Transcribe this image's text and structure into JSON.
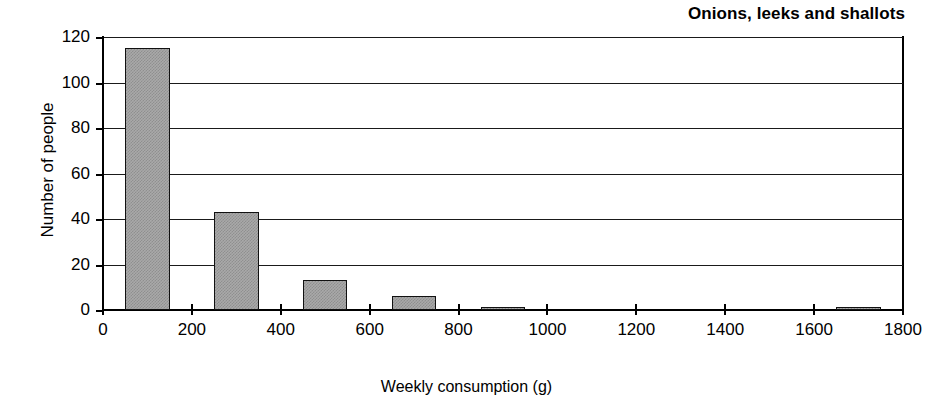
{
  "chart_data": {
    "type": "bar",
    "title": "Onions, leeks and shallots",
    "xlabel": "Weekly consumption (g)",
    "ylabel": "Number of people",
    "xlim": [
      0,
      1800
    ],
    "ylim": [
      0,
      120
    ],
    "grid": true,
    "legend": "none",
    "bin_width": 100,
    "xticks": [
      {
        "value": 0,
        "label": "0"
      },
      {
        "value": 200,
        "label": "200"
      },
      {
        "value": 400,
        "label": "400"
      },
      {
        "value": 600,
        "label": "600"
      },
      {
        "value": 800,
        "label": "800"
      },
      {
        "value": 1000,
        "label": "1000"
      },
      {
        "value": 1200,
        "label": "1200"
      },
      {
        "value": 1400,
        "label": "1400"
      },
      {
        "value": 1600,
        "label": "1600"
      },
      {
        "value": 1800,
        "label": "1800"
      }
    ],
    "yticks": [
      {
        "value": 0,
        "label": "0"
      },
      {
        "value": 20,
        "label": "20"
      },
      {
        "value": 40,
        "label": "40"
      },
      {
        "value": 60,
        "label": "60"
      },
      {
        "value": 80,
        "label": "80"
      },
      {
        "value": 100,
        "label": "100"
      },
      {
        "value": 120,
        "label": "120"
      }
    ],
    "bars": [
      {
        "x_start": 50,
        "x_end": 150,
        "center": 100,
        "value": 115
      },
      {
        "x_start": 250,
        "x_end": 350,
        "center": 300,
        "value": 43
      },
      {
        "x_start": 450,
        "x_end": 550,
        "center": 500,
        "value": 13
      },
      {
        "x_start": 650,
        "x_end": 750,
        "center": 700,
        "value": 6
      },
      {
        "x_start": 850,
        "x_end": 950,
        "center": 900,
        "value": 1.5
      },
      {
        "x_start": 1650,
        "x_end": 1750,
        "center": 1700,
        "value": 1
      }
    ],
    "categories": [
      100,
      300,
      500,
      700,
      900,
      1700
    ],
    "values": [
      115,
      43,
      13,
      6,
      1.5,
      1
    ],
    "colors": {
      "bar_fill": "#a9a9a9",
      "bar_border": "#111111",
      "axis": "#000000",
      "gridline": "#1a1a1a",
      "background": "#ffffff"
    }
  }
}
